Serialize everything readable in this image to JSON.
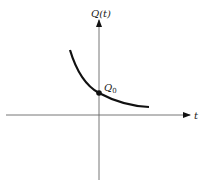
{
  "diagram": {
    "type": "function-graph",
    "y_axis_label": "Q(t)",
    "x_axis_label": "t",
    "point_label_main": "Q",
    "point_label_sub": "0",
    "colors": {
      "axis": "#555555",
      "curve": "#111111",
      "background": "#ffffff"
    }
  }
}
